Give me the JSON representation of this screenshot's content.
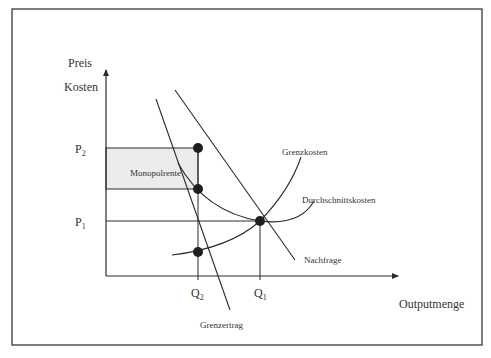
{
  "diagram": {
    "y_axis_label_line1": "Preis",
    "y_axis_label_line2": "Kosten",
    "x_axis_label": "Outputmenge",
    "price_labels": {
      "p2": "P",
      "p2_sub": "2",
      "p1": "P",
      "p1_sub": "1"
    },
    "quantity_labels": {
      "q2": "Q",
      "q2_sub": "2",
      "q1": "Q",
      "q1_sub": "1"
    },
    "area_label": "Monopolrente",
    "curves": {
      "marginal_cost": "Grenzkosten",
      "average_cost": "Durchschnittskosten",
      "demand": "Nachfrage",
      "marginal_revenue": "Grenzertrag"
    },
    "colors": {
      "line": "#2b2b2b",
      "shaded_area": "#ececec",
      "frame": "#3a3a3a"
    }
  }
}
